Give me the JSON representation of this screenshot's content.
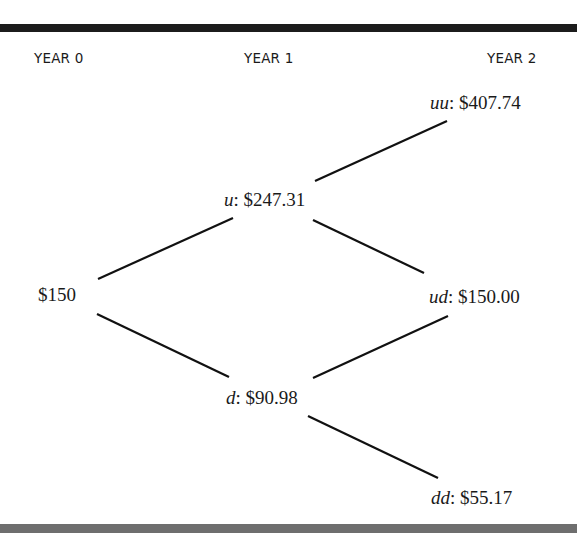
{
  "headers": {
    "year0": "YEAR 0",
    "year1": "YEAR 1",
    "year2": "YEAR 2"
  },
  "nodes": {
    "root": {
      "label": "",
      "value": "$150"
    },
    "u": {
      "label": "u",
      "sep": ": ",
      "value": "$247.31"
    },
    "d": {
      "label": "d",
      "sep": ": ",
      "value": "$90.98"
    },
    "uu": {
      "label": "uu",
      "sep": ": ",
      "value": "$407.74"
    },
    "ud": {
      "label": "ud",
      "sep": ": ",
      "value": "$150.00"
    },
    "dd": {
      "label": "dd",
      "sep": ": ",
      "value": "$55.17"
    }
  },
  "edges": [
    {
      "from": "root",
      "to": "u"
    },
    {
      "from": "root",
      "to": "d"
    },
    {
      "from": "u",
      "to": "uu"
    },
    {
      "from": "u",
      "to": "ud"
    },
    {
      "from": "d",
      "to": "ud"
    },
    {
      "from": "d",
      "to": "dd"
    }
  ],
  "colors": {
    "top_rule": "#1c1c1c",
    "bottom_rule": "#6e6e6e",
    "ink": "#111111"
  }
}
